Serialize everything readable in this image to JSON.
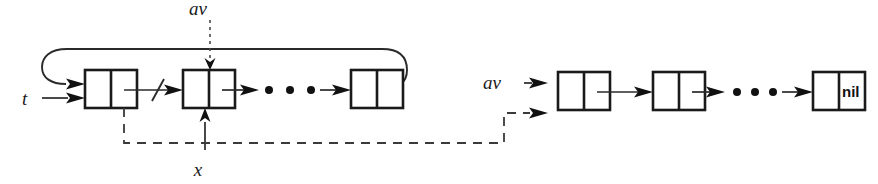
{
  "figure": {
    "background_color": "#ffffff",
    "ink_color": "#1a1a1a",
    "width": 878,
    "height": 184
  },
  "labels": {
    "t": "t",
    "av_top": "av",
    "x": "x",
    "av_right": "av",
    "nil": "nil"
  },
  "diagram_data": {
    "type": "diagram",
    "description": "Two singly linked lists drawn as two-cell node boxes. Left: circular list headed by pointer t, with node pointed to by av being inserted and node x; the link out of the first node is crossed out by a slash. Right: the available-space list headed by av, terminated by nil.",
    "lists": [
      {
        "name": "left-list",
        "head_pointer": "t",
        "circular": true,
        "terminator": null,
        "node_count_visible": 3,
        "ellipsis": true,
        "incoming_pointers": [
          "t",
          "av",
          "x"
        ],
        "cut_link": {
          "between_nodes": [
            1,
            2
          ],
          "marker": "slash"
        }
      },
      {
        "name": "right-list",
        "head_pointer": "av",
        "circular": false,
        "terminator": "nil",
        "node_count_visible": 3,
        "ellipsis": true,
        "incoming_pointers": [
          "av"
        ]
      }
    ],
    "pointer_arrows": [
      {
        "from": "t",
        "to": "left-node-1",
        "style": "solid"
      },
      {
        "from": "left-loop-back",
        "to": "left-node-1",
        "style": "solid"
      },
      {
        "from": "av_top",
        "to": "left-node-2",
        "style": "dotted"
      },
      {
        "from": "x",
        "to": "left-node-2",
        "style": "solid"
      },
      {
        "from": "left-node-1-link-cell",
        "to": "right-node-1",
        "style": "dashed"
      },
      {
        "from": "av_right",
        "to": "right-node-1",
        "style": "solid"
      }
    ],
    "node_shape": "rectangle split into two cells (data cell, link cell)"
  }
}
